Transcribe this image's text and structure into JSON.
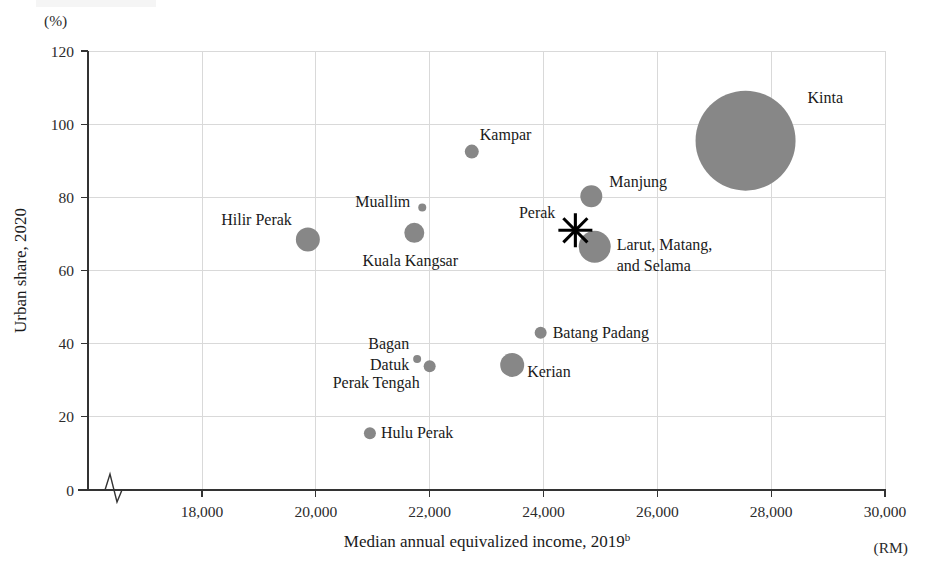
{
  "chart_data": {
    "type": "scatter",
    "title": "",
    "xlabel": "Median annual equivalized income, 2019",
    "xlabel_superscript": "b",
    "xunit": "(RM)",
    "ylabel": "Urban share, 2020",
    "yunit": "(%)",
    "xlim": [
      16500,
      30000
    ],
    "ylim": [
      0,
      120
    ],
    "x_ticks": [
      "18,000",
      "20,000",
      "22,000",
      "24,000",
      "26,000",
      "28,000",
      "30,000"
    ],
    "x_tick_values": [
      18000,
      20000,
      22000,
      24000,
      26000,
      28000,
      30000
    ],
    "y_ticks": [
      "0",
      "20",
      "40",
      "60",
      "80",
      "100",
      "120"
    ],
    "y_tick_values": [
      0,
      20,
      40,
      60,
      80,
      100,
      120
    ],
    "grid": true,
    "legend": "none",
    "axis_break": true,
    "bubble_color": "#878787",
    "marker_color": "#000000",
    "points": [
      {
        "name": "Kinta",
        "x": 27550,
        "y": 95.5,
        "size": 50,
        "label_dx": 62,
        "label_dy": -38,
        "label_anchor": "start"
      },
      {
        "name": "Kampar",
        "x": 22740,
        "y": 92.5,
        "size": 7,
        "label_dx": 8,
        "label_dy": -12,
        "label_anchor": "start"
      },
      {
        "name": "Manjung",
        "x": 24840,
        "y": 80.3,
        "size": 11,
        "label_dx": 18,
        "label_dy": -9,
        "label_anchor": "start"
      },
      {
        "name": "Muallim",
        "x": 21870,
        "y": 77.2,
        "size": 4,
        "label_dx": -12,
        "label_dy": -1,
        "label_anchor": "end"
      },
      {
        "name": "Hilir Perak",
        "x": 19860,
        "y": 68.5,
        "size": 12,
        "label_dx": -16,
        "label_dy": -14,
        "label_anchor": "end"
      },
      {
        "name": "Kuala Kangsar",
        "x": 21730,
        "y": 70.3,
        "size": 10,
        "label_dx": -4,
        "label_dy": 33,
        "label_anchor": "middle"
      },
      {
        "name": "Larut, Matang, and Selama",
        "x": 24900,
        "y": 66.5,
        "size": 16,
        "label_dx": 22,
        "label_dy": 3,
        "label_anchor": "start"
      },
      {
        "name": "Batang Padang",
        "x": 23950,
        "y": 43.0,
        "size": 6,
        "label_dx": 12,
        "label_dy": 5,
        "label_anchor": "start"
      },
      {
        "name": "Bagan Datuk",
        "x": 21780,
        "y": 35.8,
        "size": 4,
        "label_dx": -8,
        "label_dy": -10,
        "label_anchor": "end"
      },
      {
        "name": "Perak Tengah",
        "x": 22000,
        "y": 33.8,
        "size": 6,
        "label_dx": -10,
        "label_dy": 22,
        "label_anchor": "end"
      },
      {
        "name": "Kerian",
        "x": 23450,
        "y": 34.2,
        "size": 12,
        "label_dx": 15,
        "label_dy": 12,
        "label_anchor": "start"
      },
      {
        "name": "Hulu Perak",
        "x": 20950,
        "y": 15.5,
        "size": 6,
        "label_dx": 11,
        "label_dy": 5,
        "label_anchor": "start"
      }
    ],
    "marker_point": {
      "name": "Perak",
      "x": 24560,
      "y": 71.0,
      "label_dx": -20,
      "label_dy": -12,
      "label_anchor": "end",
      "marker": "asterisk"
    }
  }
}
